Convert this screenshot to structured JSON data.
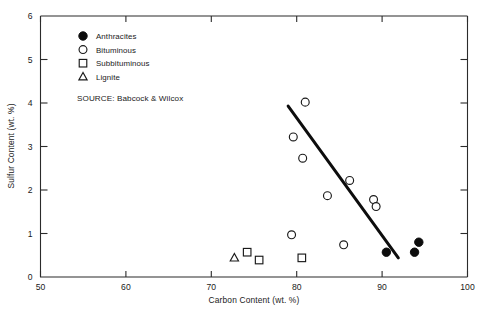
{
  "chart_data": {
    "type": "scatter",
    "title": "",
    "xlabel": "Carbon Content (wt. %)",
    "ylabel": "Sulfur Content (wt. %)",
    "xlim": [
      50,
      100
    ],
    "ylim": [
      0,
      6
    ],
    "xticks": [
      50,
      60,
      70,
      80,
      90,
      100
    ],
    "yticks": [
      0,
      1,
      2,
      3,
      4,
      5,
      6
    ],
    "xtick_labels": [
      "50",
      "60",
      "70",
      "80",
      "90",
      "100"
    ],
    "ytick_labels": [
      "0",
      "1",
      "2",
      "3",
      "4",
      "5",
      "6"
    ],
    "grid": false,
    "legend_position": "upper-left-inside",
    "annotations": [
      "SOURCE:  Babcock & Wilcox"
    ],
    "series": [
      {
        "name": "Anthracites",
        "marker": "filled-circle",
        "color": "#0d0d0d",
        "points": [
          {
            "x": 90.5,
            "y": 0.57
          },
          {
            "x": 93.8,
            "y": 0.57
          },
          {
            "x": 94.3,
            "y": 0.8
          }
        ]
      },
      {
        "name": "Bituminous",
        "marker": "open-circle",
        "color": "#1a1a1a",
        "points": [
          {
            "x": 81.0,
            "y": 4.02
          },
          {
            "x": 79.6,
            "y": 3.22
          },
          {
            "x": 80.7,
            "y": 2.73
          },
          {
            "x": 86.2,
            "y": 2.22
          },
          {
            "x": 83.6,
            "y": 1.87
          },
          {
            "x": 89.0,
            "y": 1.78
          },
          {
            "x": 89.3,
            "y": 1.62
          },
          {
            "x": 79.4,
            "y": 0.97
          },
          {
            "x": 85.5,
            "y": 0.74
          }
        ]
      },
      {
        "name": "Subbituminous",
        "marker": "open-square",
        "color": "#1a1a1a",
        "points": [
          {
            "x": 74.2,
            "y": 0.57
          },
          {
            "x": 75.6,
            "y": 0.39
          },
          {
            "x": 80.6,
            "y": 0.44
          }
        ]
      },
      {
        "name": "Lignite",
        "marker": "open-triangle",
        "color": "#1a1a1a",
        "points": [
          {
            "x": 72.7,
            "y": 0.44
          }
        ]
      }
    ],
    "trend_line": {
      "x1": 79.0,
      "y1": 3.93,
      "x2": 91.9,
      "y2": 0.44
    }
  },
  "legend": {
    "items": [
      {
        "label": "Anthracites",
        "marker": "filled-circle"
      },
      {
        "label": "Bituminous",
        "marker": "open-circle"
      },
      {
        "label": "Subbituminous",
        "marker": "open-square"
      },
      {
        "label": "Lignite",
        "marker": "open-triangle"
      }
    ],
    "source": "SOURCE:  Babcock & Wilcox"
  }
}
